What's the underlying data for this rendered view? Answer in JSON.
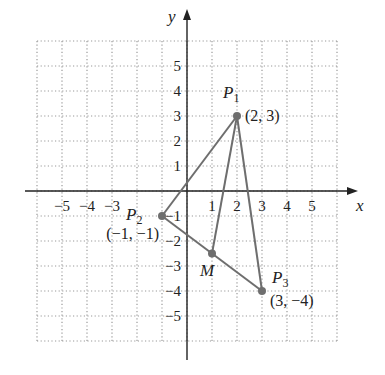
{
  "chart_data": {
    "type": "scatter",
    "title": "",
    "xlabel": "x",
    "ylabel": "y",
    "xlim": [
      -6,
      6
    ],
    "ylim": [
      -6,
      6
    ],
    "grid": true,
    "x_ticks": [
      -5,
      -4,
      -3,
      1,
      2,
      3,
      4,
      5
    ],
    "y_ticks": [
      5,
      4,
      3,
      2,
      1,
      -1,
      -2,
      -3,
      -4,
      -5
    ],
    "x_tick_labels": [
      "−5",
      "−4",
      "−3",
      "1",
      "2",
      "3",
      "4",
      "5"
    ],
    "y_tick_labels": [
      "5",
      "4",
      "3",
      "2",
      "1",
      "−1",
      "−2",
      "−3",
      "−4",
      "−5"
    ],
    "points": [
      {
        "name": "P1",
        "label": "P",
        "subscript": "1",
        "x": 2,
        "y": 3,
        "coord_label": "(2, 3)"
      },
      {
        "name": "P2",
        "label": "P",
        "subscript": "2",
        "x": -1,
        "y": -1,
        "coord_label": "(−1, −1)"
      },
      {
        "name": "P3",
        "label": "P",
        "subscript": "3",
        "x": 3,
        "y": -4,
        "coord_label": "(3, −4)"
      },
      {
        "name": "M",
        "label": "M",
        "subscript": "",
        "x": 1,
        "y": -2.5,
        "coord_label": ""
      }
    ],
    "segments": [
      {
        "from": "P1",
        "to": "P2"
      },
      {
        "from": "P2",
        "to": "P3"
      },
      {
        "from": "P1",
        "to": "P3"
      },
      {
        "from": "P1",
        "to": "M"
      }
    ],
    "colors": {
      "lines": "#6e6e6e",
      "points": "#6e6e6e",
      "grid": "#9a9a9a",
      "axes": "#222222"
    }
  }
}
